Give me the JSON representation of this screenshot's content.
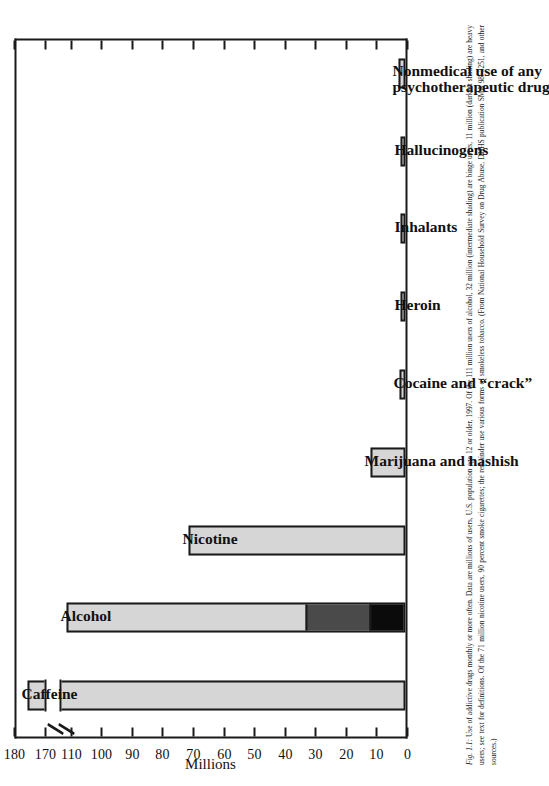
{
  "figure": {
    "label": "Fig. 1.1:",
    "caption_lines": [
      "Use of addictive drugs monthly or more often. Data are millions of users, U.S. population age 12 or older, 1997. Of the 111 million users of alcohol, 32 million",
      "(intermediate shading) are binge users, 11 million (darkest shading) are heavy users; see text for definitions. Of the 71 million nicotine users, 90 percent smoke",
      "cigarettes; the remainder use various forms of smokeless tobacco. (From National Household Survey on Drug Abuse, DHHS publication SMA 98–3251, and other",
      "sources.)"
    ]
  },
  "chart_data": {
    "type": "bar",
    "title": "",
    "xlabel": "",
    "ylabel": "Millions",
    "ylim": [
      0,
      180
    ],
    "axis_break": {
      "from": 112,
      "to": 168,
      "present": true
    },
    "grid": false,
    "legend": false,
    "tick_labels": [
      "0",
      "10",
      "20",
      "30",
      "40",
      "50",
      "60",
      "70",
      "80",
      "90",
      "100",
      "110",
      "170",
      "180"
    ],
    "tick_values": [
      0,
      10,
      20,
      30,
      40,
      50,
      60,
      70,
      80,
      90,
      100,
      110,
      170,
      180
    ],
    "categories": [
      "Caffeine",
      "Alcohol",
      "Nicotine",
      "Marijuana and hashish",
      "Cocaine and “crack”",
      "Heroin",
      "Inhalants",
      "Hallucinogens",
      "Nonmedical use of any psychotherapeutic drug"
    ],
    "values": [
      175,
      111,
      71,
      11.5,
      2.0,
      0.6,
      1.0,
      1.6,
      2.4
    ],
    "series": [
      {
        "name": "Total users",
        "values": [
          175,
          111,
          71,
          11.5,
          2.0,
          0.6,
          1.0,
          1.6,
          2.4
        ]
      },
      {
        "name": "Binge users (intermediate shading)",
        "values": [
          null,
          32,
          null,
          null,
          null,
          null,
          null,
          null,
          null
        ]
      },
      {
        "name": "Heavy users (darkest shading)",
        "values": [
          null,
          11,
          null,
          null,
          null,
          null,
          null,
          null,
          null
        ]
      }
    ],
    "annotations": [
      "Caffeine bar is broken between 112 and 168 million",
      "Alcohol bar is segmented: 11 M heavy (black), 32 M binge (dark gray), 111 M total (light gray)"
    ],
    "colors": {
      "bar_fill": "#d6d6d6",
      "binge_fill": "#4a4a4a",
      "heavy_fill": "#0b0b0b",
      "outline": "#1a1a1a",
      "background": "#ffffff"
    }
  }
}
